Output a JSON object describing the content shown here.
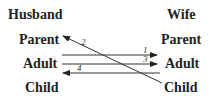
{
  "diagram": {
    "left_header": "Husband",
    "right_header": "Wife",
    "left_states": [
      "Parent",
      "Adult",
      "Child"
    ],
    "right_states": [
      "Parent",
      "Adult",
      "Child"
    ],
    "transactions": [
      {
        "label": "1",
        "from": "Husband Adult",
        "to": "Wife Adult"
      },
      {
        "label": "2",
        "from": "Wife Child",
        "to": "Husband Parent"
      },
      {
        "label": "3",
        "from": "Husband Adult",
        "to": "Wife Adult"
      },
      {
        "label": "4",
        "from": "Wife Adult",
        "to": "Husband Adult"
      }
    ]
  }
}
